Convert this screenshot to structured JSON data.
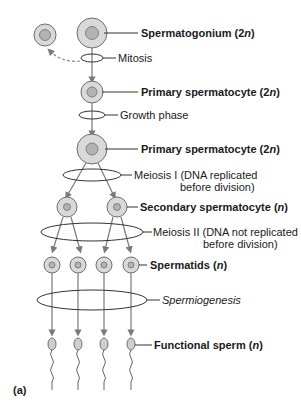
{
  "diagram": {
    "title_panel": "(a)",
    "stages": [
      {
        "label": "Spermatogonium",
        "ploidy": "2n"
      },
      {
        "label": "Primary spermatocyte",
        "ploidy": "2n"
      },
      {
        "label": "Primary spermatocyte",
        "ploidy": "2n"
      },
      {
        "label": "Secondary spermatocyte",
        "ploidy": "n"
      },
      {
        "label": "Spermatids",
        "ploidy": "n"
      },
      {
        "label": "Functional sperm",
        "ploidy": "n"
      }
    ],
    "processes": [
      {
        "label": "Mitosis"
      },
      {
        "label": "Growth phase"
      },
      {
        "label_line1": "Meiosis I (DNA replicated",
        "label_line2": "before division)"
      },
      {
        "label_line1": "Meiosis II (DNA not replicated",
        "label_line2": "before division)"
      },
      {
        "label": "Spermiogenesis"
      }
    ]
  },
  "labels": {
    "spermatogonium": "Spermatogonium (2",
    "primary1": "Primary spermatocyte (2",
    "primary2": "Primary spermatocyte (2",
    "secondary": "Secondary spermatocyte (",
    "spermatids": "Spermatids (",
    "sperm": "Functional sperm (",
    "n": "n",
    "close": ")",
    "mitosis": "Mitosis",
    "growth": "Growth phase",
    "meiosis1_a": "Meiosis I (DNA replicated",
    "meiosis1_b": "before division)",
    "meiosis2_a": "Meiosis II (DNA not replicated",
    "meiosis2_b": "before division)",
    "spermiogenesis": "Spermiogenesis",
    "panel": "(a)"
  },
  "colors": {
    "cell_fill": "#d9d9d9",
    "nucleus_fill": "#b3b3b3",
    "stroke": "#6e6e6e",
    "line": "#333333"
  }
}
